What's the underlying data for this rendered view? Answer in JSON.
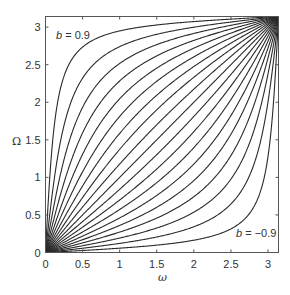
{
  "chart_data": {
    "type": "line",
    "title": "",
    "xlabel": "ω",
    "ylabel": "Ω",
    "xlim": [
      0,
      3.14159
    ],
    "ylim": [
      0,
      3.14159
    ],
    "grid": false,
    "legend": null,
    "x_ticks": [
      "0",
      "0.5",
      "1",
      "1.5",
      "2",
      "2.5",
      "3"
    ],
    "y_ticks": [
      "0",
      "0.5",
      "1",
      "1.5",
      "2",
      "2.5",
      "3"
    ],
    "annotations": [
      {
        "text_var": "b",
        "text_rest": " = 0.9",
        "near": "top-left curve"
      },
      {
        "text_var": "b",
        "text_rest": " = −0.9",
        "near": "bottom-right curve"
      }
    ],
    "relation": "tan(Ω/2) = ((1+b)/(1−b))·tan(ω/2)",
    "x": [
      0,
      0.5,
      1,
      1.5,
      2,
      2.5,
      3,
      3.14159
    ],
    "series": [
      {
        "name": "b = -0.9",
        "b": -0.9,
        "values": [
          0,
          0.03,
          0.06,
          0.1,
          0.16,
          0.31,
          1.28,
          3.14159
        ]
      },
      {
        "name": "b = -0.8",
        "b": -0.8,
        "values": [
          0,
          0.06,
          0.12,
          0.21,
          0.34,
          0.65,
          2.01,
          3.14159
        ]
      },
      {
        "name": "b = -0.7",
        "b": -0.7,
        "values": [
          0,
          0.09,
          0.19,
          0.33,
          0.54,
          0.98,
          2.38,
          3.14159
        ]
      },
      {
        "name": "b = -0.6",
        "b": -0.6,
        "values": [
          0,
          0.13,
          0.27,
          0.46,
          0.74,
          1.29,
          2.59,
          3.14159
        ]
      },
      {
        "name": "b = -0.5",
        "b": -0.5,
        "values": [
          0,
          0.17,
          0.36,
          0.6,
          0.96,
          1.57,
          2.72,
          3.14159
        ]
      },
      {
        "name": "b = -0.4",
        "b": -0.4,
        "values": [
          0,
          0.22,
          0.46,
          0.76,
          1.18,
          1.82,
          2.81,
          3.14159
        ]
      },
      {
        "name": "b = -0.3",
        "b": -0.3,
        "values": [
          0,
          0.27,
          0.57,
          0.93,
          1.4,
          2.04,
          2.88,
          3.14159
        ]
      },
      {
        "name": "b = -0.2",
        "b": -0.2,
        "values": [
          0,
          0.34,
          0.7,
          1.11,
          1.61,
          2.22,
          2.93,
          3.14159
        ]
      },
      {
        "name": "b = -0.1",
        "b": -0.1,
        "values": [
          0,
          0.41,
          0.84,
          1.3,
          1.81,
          2.37,
          2.97,
          3.14159
        ]
      },
      {
        "name": "b = 0",
        "b": 0.0,
        "values": [
          0,
          0.5,
          1.0,
          1.5,
          2.0,
          2.5,
          3.0,
          3.14159
        ]
      },
      {
        "name": "b = 0.1",
        "b": 0.1,
        "values": [
          0,
          0.6,
          1.18,
          1.7,
          2.17,
          2.61,
          3.03,
          3.14159
        ]
      },
      {
        "name": "b = 0.2",
        "b": 0.2,
        "values": [
          0,
          0.73,
          1.37,
          1.9,
          2.33,
          2.71,
          3.05,
          3.14159
        ]
      },
      {
        "name": "b = 0.3",
        "b": 0.3,
        "values": [
          0,
          0.88,
          1.59,
          2.09,
          2.48,
          2.79,
          3.07,
          3.14159
        ]
      },
      {
        "name": "b = 0.4",
        "b": 0.4,
        "values": [
          0,
          1.07,
          1.81,
          2.28,
          2.6,
          2.86,
          3.08,
          3.14159
        ]
      },
      {
        "name": "b = 0.5",
        "b": 0.5,
        "values": [
          0,
          1.31,
          2.05,
          2.45,
          2.72,
          2.92,
          3.09,
          3.14159
        ]
      },
      {
        "name": "b = 0.6",
        "b": 0.6,
        "values": [
          0,
          1.59,
          2.28,
          2.62,
          2.82,
          2.98,
          3.11,
          3.14159
        ]
      },
      {
        "name": "b = 0.7",
        "b": 0.7,
        "values": [
          0,
          1.93,
          2.52,
          2.77,
          2.92,
          3.02,
          3.12,
          3.14159
        ]
      },
      {
        "name": "b = 0.8",
        "b": 0.8,
        "values": [
          0,
          2.32,
          2.74,
          2.9,
          3.0,
          3.07,
          3.13,
          3.14159
        ]
      },
      {
        "name": "b = 0.9",
        "b": 0.9,
        "values": [
          0,
          2.74,
          2.95,
          3.03,
          3.07,
          3.11,
          3.13,
          3.14159
        ]
      }
    ]
  },
  "axes": {
    "xlabel": "ω",
    "ylabel": "Ω",
    "x_ticks": [
      {
        "label": "0",
        "value": 0
      },
      {
        "label": "0.5",
        "value": 0.5
      },
      {
        "label": "1",
        "value": 1
      },
      {
        "label": "1.5",
        "value": 1.5
      },
      {
        "label": "2",
        "value": 2
      },
      {
        "label": "2.5",
        "value": 2.5
      },
      {
        "label": "3",
        "value": 3
      }
    ],
    "y_ticks": [
      {
        "label": "0",
        "value": 0
      },
      {
        "label": "0.5",
        "value": 0.5
      },
      {
        "label": "1",
        "value": 1
      },
      {
        "label": "1.5",
        "value": 1.5
      },
      {
        "label": "2",
        "value": 2
      },
      {
        "label": "2.5",
        "value": 2.5
      },
      {
        "label": "3",
        "value": 3
      }
    ]
  },
  "annotations": {
    "top": {
      "var": "b",
      "rest": " = 0.9"
    },
    "bottom": {
      "var": "b",
      "rest": " = −0.9"
    }
  },
  "colors": {
    "curve": "#2a2a2a",
    "frame": "#555555",
    "text": "#333333",
    "background": "#ffffff"
  }
}
